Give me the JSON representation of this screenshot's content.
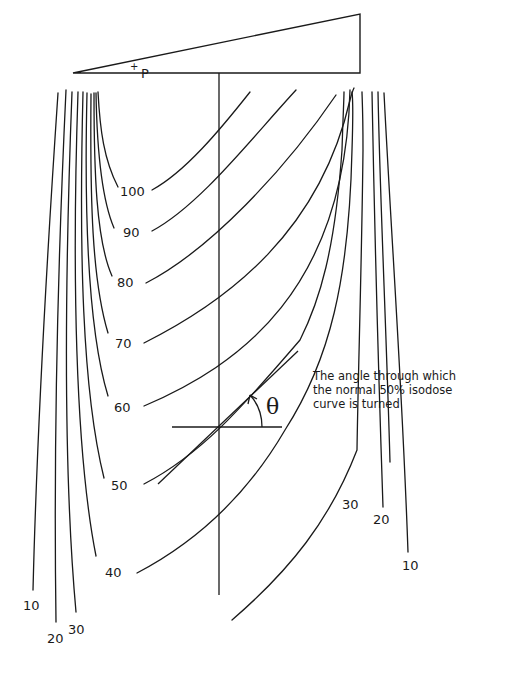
{
  "diagram": {
    "point_label": "P",
    "point_marker": "+",
    "theta_symbol": "θ",
    "annotation": {
      "line1": "The angle through which",
      "line2": "the normal 50% isodose",
      "line3": "curve is turned"
    },
    "left_labels": {
      "l100": "100",
      "l90": "90",
      "l80": "80",
      "l70": "70",
      "l60": "60",
      "l50": "50",
      "l40": "40",
      "l30": "30",
      "l20": "20",
      "l10": "10"
    },
    "right_labels": {
      "r30": "30",
      "r20": "20",
      "r10": "10"
    },
    "isodose_levels": [
      100,
      90,
      80,
      70,
      60,
      50,
      40,
      30,
      20,
      10
    ],
    "colors": {
      "line": "#1a1a1a",
      "background": "#ffffff"
    }
  }
}
